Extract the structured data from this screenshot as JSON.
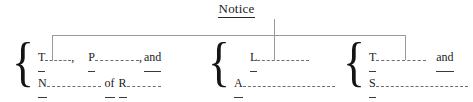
{
  "title": {
    "text": "Notice"
  },
  "connector": {
    "line_color": "#9a9a9a"
  },
  "groups": [
    {
      "name": "left",
      "brace": "{",
      "rows": [
        {
          "segments": [
            {
              "kind": "prompt",
              "text": "T"
            },
            {
              "kind": "blank",
              "width": 26
            },
            {
              "kind": "plain",
              "text": ","
            },
            {
              "kind": "gap",
              "width": 14
            },
            {
              "kind": "prompt",
              "text": "P"
            },
            {
              "kind": "blank",
              "width": 44
            },
            {
              "kind": "plain",
              "text": ","
            },
            {
              "kind": "gap",
              "width": 2
            },
            {
              "kind": "uword",
              "text": "and"
            }
          ]
        },
        {
          "segments": [
            {
              "kind": "prompt",
              "text": "N"
            },
            {
              "kind": "blank",
              "width": 54
            },
            {
              "kind": "gap",
              "width": 4
            },
            {
              "kind": "uword",
              "text": "of"
            },
            {
              "kind": "gap",
              "width": 4
            },
            {
              "kind": "uword",
              "text": "R"
            },
            {
              "kind": "blank",
              "width": 34
            }
          ]
        }
      ]
    },
    {
      "name": "middle",
      "brace": "{",
      "rows": [
        {
          "segments": [
            {
              "kind": "gap",
              "width": 16
            },
            {
              "kind": "prompt",
              "text": "L"
            },
            {
              "kind": "blank",
              "width": 52
            }
          ]
        },
        {
          "segments": [
            {
              "kind": "prompt",
              "text": "A"
            },
            {
              "kind": "blank",
              "width": 92
            }
          ]
        }
      ]
    },
    {
      "name": "right",
      "brace": "{",
      "rows": [
        {
          "segments": [
            {
              "kind": "prompt",
              "text": "T"
            },
            {
              "kind": "blank",
              "width": 50
            },
            {
              "kind": "gap",
              "width": 10
            },
            {
              "kind": "uword",
              "text": "and"
            }
          ]
        },
        {
          "segments": [
            {
              "kind": "prompt",
              "text": "S"
            },
            {
              "kind": "blank",
              "width": 92
            }
          ]
        }
      ]
    }
  ]
}
